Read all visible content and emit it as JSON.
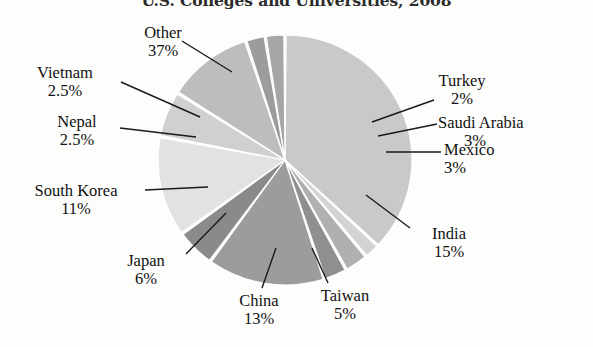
{
  "chart_data": {
    "type": "pie",
    "title": "U.S. Colleges and Universities, 2008",
    "xlabel": "",
    "ylabel": "",
    "legend": "none",
    "labels_position": "outside-with-leader-lines",
    "categories": [
      "Other",
      "Turkey",
      "Saudi Arabia",
      "Mexico",
      "India",
      "Taiwan",
      "China",
      "Japan",
      "South Korea",
      "Nepal",
      "Vietnam"
    ],
    "values": [
      37,
      2,
      3,
      3,
      15,
      5,
      13,
      6,
      11,
      2.5,
      2.5
    ],
    "value_labels": [
      "37%",
      "2%",
      "3%",
      "3%",
      "15%",
      "5%",
      "13%",
      "6%",
      "11%",
      "2.5%",
      "2.5%"
    ],
    "slice_colors": [
      "#c9c9c9",
      "#d3d3d3",
      "#b0b0b0",
      "#8f8f8f",
      "#9c9c9c",
      "#8a8a8a",
      "#e2e2e2",
      "#d0d0d0",
      "#bdbdbd",
      "#9c9c9c",
      "#a6a6a6"
    ],
    "start_angle_deg": 0,
    "direction": "clockwise",
    "units": "percent",
    "total": 100
  },
  "slices": [
    {
      "name": "Other",
      "value": 37,
      "value_label": "37%",
      "color": "#c9c9c9"
    },
    {
      "name": "Turkey",
      "value": 2,
      "value_label": "2%",
      "color": "#d3d3d3"
    },
    {
      "name": "Saudi Arabia",
      "value": 3,
      "value_label": "3%",
      "color": "#b0b0b0"
    },
    {
      "name": "Mexico",
      "value": 3,
      "value_label": "3%",
      "color": "#8f8f8f"
    },
    {
      "name": "India",
      "value": 15,
      "value_label": "15%",
      "color": "#9c9c9c"
    },
    {
      "name": "Taiwan",
      "value": 5,
      "value_label": "5%",
      "color": "#8a8a8a"
    },
    {
      "name": "China",
      "value": 13,
      "value_label": "13%",
      "color": "#e2e2e2"
    },
    {
      "name": "Japan",
      "value": 6,
      "value_label": "6%",
      "color": "#d0d0d0"
    },
    {
      "name": "South Korea",
      "value": 11,
      "value_label": "11%",
      "color": "#bdbdbd"
    },
    {
      "name": "Nepal",
      "value": 2.5,
      "value_label": "2.5%",
      "color": "#9c9c9c"
    },
    {
      "name": "Vietnam",
      "value": 2.5,
      "value_label": "2.5%",
      "color": "#a6a6a6"
    }
  ],
  "labels": {
    "other": {
      "name": "Other",
      "value": "37%"
    },
    "vietnam": {
      "name": "Vietnam",
      "value": "2.5%"
    },
    "nepal": {
      "name": "Nepal",
      "value": "2.5%"
    },
    "south_korea": {
      "name": "South Korea",
      "value": "11%"
    },
    "japan": {
      "name": "Japan",
      "value": "6%"
    },
    "china": {
      "name": "China",
      "value": "13%"
    },
    "taiwan": {
      "name": "Taiwan",
      "value": "5%"
    },
    "india": {
      "name": "India",
      "value": "15%"
    },
    "mexico": {
      "name": "Mexico",
      "value": "3%"
    },
    "saudi_arabia": {
      "name": "Saudi Arabia",
      "value": "3%"
    },
    "turkey": {
      "name": "Turkey",
      "value": "2%"
    }
  }
}
